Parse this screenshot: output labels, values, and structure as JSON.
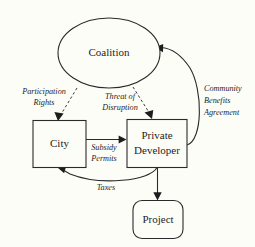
{
  "diagram": {
    "background_color": "#fdfdf8",
    "line_color": "#2a2a2a",
    "text_color": "#1d1d1d",
    "nodes": [
      {
        "id": "coalition",
        "label": "Coalition",
        "shape": "ellipse"
      },
      {
        "id": "city",
        "label": "City",
        "shape": "rectangle"
      },
      {
        "id": "developer",
        "label_line1": "Private",
        "label_line2": "Developer",
        "shape": "rectangle"
      },
      {
        "id": "project",
        "label": "Project",
        "shape": "rounded-rectangle"
      }
    ],
    "edges": [
      {
        "id": "participation-rights",
        "from": "coalition",
        "to": "city",
        "style": "dashed",
        "label_line1": "Participation",
        "label_line2": "Rights"
      },
      {
        "id": "threat-of-disruption",
        "from": "coalition",
        "to": "developer",
        "style": "dashed",
        "label_line1": "Threat of",
        "label_line2": "Disruption"
      },
      {
        "id": "community-benefits-agreement",
        "from": "developer",
        "to": "coalition",
        "style": "solid",
        "label_line1": "Community",
        "label_line2": "Benefits",
        "label_line3": "Agreement"
      },
      {
        "id": "subsidy-permits",
        "from": "city",
        "to": "developer",
        "style": "solid",
        "label_line1": "Subsidy",
        "label_line2": "Permits"
      },
      {
        "id": "taxes",
        "from": "developer",
        "to": "city",
        "style": "solid",
        "label_line1": "Taxes"
      },
      {
        "id": "developer-to-project",
        "from": "developer",
        "to": "project",
        "style": "solid",
        "label_line1": ""
      }
    ]
  }
}
